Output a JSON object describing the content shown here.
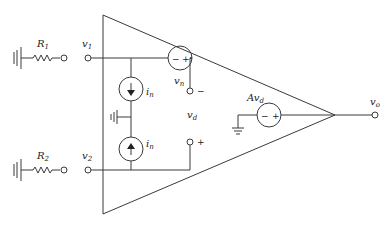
{
  "diagram": {
    "labels": {
      "R1": {
        "main": "R",
        "sub": "1"
      },
      "R2": {
        "main": "R",
        "sub": "2"
      },
      "v1": {
        "main": "v",
        "sub": "1"
      },
      "v2": {
        "main": "v",
        "sub": "2"
      },
      "vn": "v",
      "vn_sub": "n",
      "in_top": "i",
      "in_top_sub": "n",
      "in_bot": "i",
      "in_bot_sub": "n",
      "vd": "v",
      "vd_sub": "d",
      "Avd": "Av",
      "Avd_sub": "d",
      "vo": "v",
      "vo_sub": "o",
      "minus": "−",
      "plus": "+",
      "src_minus": "−",
      "src_plus": "+"
    }
  }
}
